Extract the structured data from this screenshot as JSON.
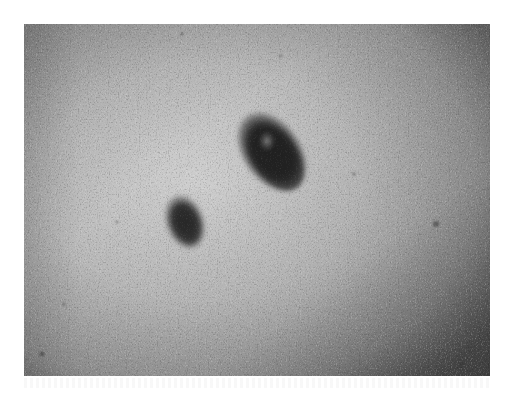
{
  "image": {
    "subject": "close-up grayscale photograph of skin with two pigmented lesions",
    "background_color": "#ffffff",
    "skin_tone_light": "#c9c9c9",
    "skin_tone_dark": "#6e6e6e",
    "lesion_color": "#1c1c1c",
    "lesions": [
      {
        "name": "large-lesion",
        "description": "larger irregular dark mole, upper center-right, with lighter central patch"
      },
      {
        "name": "small-lesion",
        "description": "smaller oval dark mole, lower-left of the larger lesion"
      }
    ]
  }
}
